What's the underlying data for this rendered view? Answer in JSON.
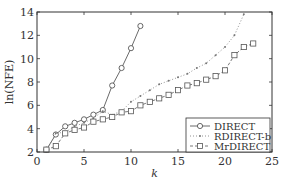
{
  "chart_data": {
    "type": "line",
    "title": "",
    "xlabel": "k",
    "ylabel": "ln(NFE)",
    "xlim": [
      0,
      25
    ],
    "ylim": [
      2,
      14
    ],
    "xticks": [
      0,
      5,
      10,
      15,
      20,
      25
    ],
    "yticks": [
      2,
      4,
      6,
      8,
      10,
      12,
      14
    ],
    "grid": false,
    "legend_position": "lower right",
    "series": [
      {
        "name": "DIRECT",
        "style": "solid",
        "marker": "circle",
        "color": "#444444",
        "x": [
          1,
          2,
          3,
          4,
          5,
          6,
          7,
          8,
          9,
          10,
          11
        ],
        "values": [
          2.2,
          3.5,
          4.2,
          4.5,
          4.8,
          5.2,
          5.6,
          7.7,
          9.2,
          10.9,
          12.8
        ]
      },
      {
        "name": "RDIRECT-b",
        "style": "dotted",
        "marker": "dot",
        "color": "#777777",
        "x": [
          1,
          2,
          3,
          4,
          5,
          6,
          7,
          8,
          9,
          10,
          11,
          12,
          13,
          14,
          15,
          16,
          17,
          18,
          19,
          20,
          21,
          22
        ],
        "values": [
          2.1,
          3.6,
          3.7,
          4.2,
          4.5,
          4.9,
          5.5,
          5.2,
          5.5,
          6.3,
          6.8,
          7.3,
          7.8,
          8.1,
          8.4,
          8.7,
          9.2,
          9.6,
          10.3,
          11.0,
          12.0,
          13.8
        ]
      },
      {
        "name": "MrDIRECT",
        "style": "dashed",
        "marker": "square",
        "color": "#555555",
        "x": [
          1,
          2,
          3,
          4,
          5,
          6,
          7,
          8,
          9,
          10,
          11,
          12,
          13,
          14,
          15,
          16,
          17,
          18,
          19,
          20,
          21,
          22,
          23
        ],
        "values": [
          2.2,
          2.5,
          3.6,
          3.9,
          4.1,
          4.6,
          4.8,
          5.0,
          5.4,
          5.5,
          6.0,
          6.3,
          6.6,
          6.9,
          7.3,
          7.7,
          7.9,
          8.2,
          8.5,
          9.0,
          10.3,
          11.0,
          11.3
        ]
      }
    ]
  },
  "legend": {
    "items": [
      {
        "label": "DIRECT"
      },
      {
        "label": "RDIRECT-b"
      },
      {
        "label": "MrDIRECT"
      }
    ]
  },
  "axes": {
    "xlabel": "k",
    "ylabel": "ln(NFE)"
  }
}
